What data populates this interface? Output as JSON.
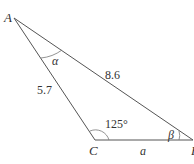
{
  "diagram": {
    "type": "triangle",
    "vertices": {
      "A": {
        "label": "A"
      },
      "B": {
        "label": "B"
      },
      "C": {
        "label": "C"
      }
    },
    "sides": {
      "AB": {
        "label": "8.6"
      },
      "AC": {
        "label": "5.7"
      },
      "CB": {
        "label": "a"
      }
    },
    "angles": {
      "A": {
        "label": "α"
      },
      "C": {
        "label": "125°"
      },
      "B": {
        "label": "β"
      }
    },
    "colors": {
      "stroke": "#555555",
      "text": "#333333",
      "background": "#ffffff"
    }
  }
}
